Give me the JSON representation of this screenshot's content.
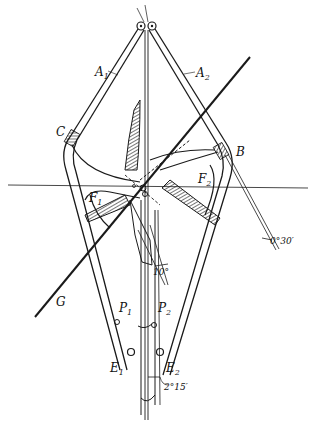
{
  "diagram": {
    "type": "mechanical linkage drawing",
    "background": "#ffffff",
    "ink": "#1a1a1a",
    "labels": {
      "A1": {
        "main": "A",
        "sub": "1"
      },
      "A2": {
        "main": "A",
        "sub": "2"
      },
      "B": {
        "main": "B"
      },
      "C": {
        "main": "C"
      },
      "F1": {
        "main": "F",
        "sub": "1"
      },
      "F2": {
        "main": "F",
        "sub": "2"
      },
      "G": {
        "main": "G"
      },
      "P1": {
        "main": "P",
        "sub": "1"
      },
      "P2": {
        "main": "P",
        "sub": "2"
      },
      "E1": {
        "main": "E",
        "sub": "1"
      },
      "E2": {
        "main": "E",
        "sub": "2"
      }
    },
    "angles": {
      "right_line": "0°30′",
      "center": "10°",
      "bottom": "2°15′"
    }
  }
}
